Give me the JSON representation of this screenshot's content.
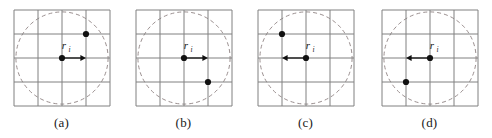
{
  "figure": {
    "type": "diagram",
    "panel_count": 4,
    "colors": {
      "grid_line": "#808080",
      "panel_border": "#808080",
      "circle_dash": "#9a8f8f",
      "dot": "#111111",
      "arrow": "#111111",
      "label": "#1a1a1a",
      "background": "#ffffff"
    },
    "geometry": {
      "grid_cells": 4,
      "panel_box_px": 96,
      "cell_px": 24,
      "dot_radius_px": 3.1,
      "circle_radius_px": 46,
      "dash_pattern": "4 3"
    },
    "panels": [
      {
        "id": "a",
        "caption": "(a)",
        "vector_label": "r",
        "vector_subscript": "i",
        "origin_cell": {
          "col": 2,
          "row": 2
        },
        "arrow_direction": "right",
        "arrow_length_cells": 1,
        "neighbor_cell": {
          "col": 3,
          "row": 1
        },
        "circle_center_cell": {
          "col": 2,
          "row": 2
        },
        "circle_radius_cells": 1.92
      },
      {
        "id": "b",
        "caption": "(b)",
        "vector_label": "r",
        "vector_subscript": "i",
        "origin_cell": {
          "col": 2,
          "row": 2
        },
        "arrow_direction": "right",
        "arrow_length_cells": 1,
        "neighbor_cell": {
          "col": 3,
          "row": 3
        },
        "circle_center_cell": {
          "col": 2,
          "row": 2
        },
        "circle_radius_cells": 1.92
      },
      {
        "id": "c",
        "caption": "(c)",
        "vector_label": "r",
        "vector_subscript": "i",
        "origin_cell": {
          "col": 2,
          "row": 2
        },
        "arrow_direction": "left",
        "arrow_length_cells": 1,
        "neighbor_cell": {
          "col": 1,
          "row": 1
        },
        "circle_center_cell": {
          "col": 2,
          "row": 2
        },
        "circle_radius_cells": 1.92
      },
      {
        "id": "d",
        "caption": "(d)",
        "vector_label": "r",
        "vector_subscript": "i",
        "origin_cell": {
          "col": 2,
          "row": 2
        },
        "arrow_direction": "left",
        "arrow_length_cells": 1,
        "neighbor_cell": {
          "col": 1,
          "row": 3
        },
        "circle_center_cell": {
          "col": 2,
          "row": 2
        },
        "circle_radius_cells": 1.92
      }
    ]
  }
}
